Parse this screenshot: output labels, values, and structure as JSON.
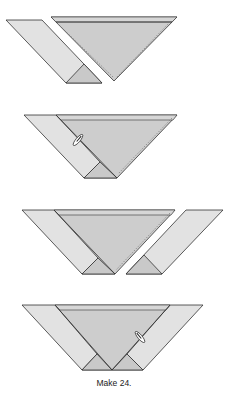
{
  "figure": {
    "caption": "Make 24.",
    "colors": {
      "background": "#ffffff",
      "strip_fill": "#e2e2e2",
      "triangle_fill": "#cdcdcd",
      "small_triangle_fill": "#c9c9c9",
      "band_fill": "#d6d6d6",
      "outline": "#333333",
      "seam_line": "#7a7a7a",
      "pin_fill": "#ffffff",
      "pin_outline": "#222222"
    },
    "steps": [
      {
        "index": 1,
        "description": "Left parallelogram strip separated from large triangle with dashed seam line",
        "has_pin": false
      },
      {
        "index": 2,
        "description": "Left strip sewn to large triangle, pinned",
        "has_pin": true
      },
      {
        "index": 3,
        "description": "Right parallelogram strip positioned beside triangle unit with dashed seam line",
        "has_pin": false
      },
      {
        "index": 4,
        "description": "Both strips sewn, completed flying-geese style unit, pinned",
        "has_pin": true
      }
    ]
  }
}
